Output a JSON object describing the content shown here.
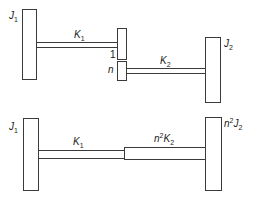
{
  "diagram": {
    "top": {
      "J1": {
        "main": "J",
        "sub": "1"
      },
      "K1": {
        "main": "K",
        "sub": "1"
      },
      "gear1": {
        "label": "1"
      },
      "gearN": {
        "label": "n"
      },
      "K2": {
        "main": "K",
        "sub": "2"
      },
      "J2": {
        "main": "J",
        "sub": "2"
      }
    },
    "bottom": {
      "J1": {
        "main": "J",
        "sub": "1"
      },
      "K1": {
        "main": "K",
        "sub": "1"
      },
      "K2eq": {
        "prefix": "n",
        "sup": "2",
        "main": "K",
        "sub": "2"
      },
      "J2eq": {
        "prefix": "n",
        "sup": "2",
        "main": "J",
        "sub": "2"
      }
    },
    "colors": {
      "stroke": "#3a3a3a",
      "fill": "#ffffff",
      "text": "#222222"
    }
  }
}
